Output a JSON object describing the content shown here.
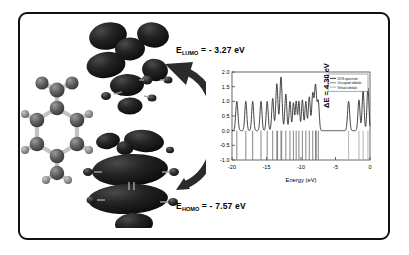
{
  "figure": {
    "kind": "graphical-abstract",
    "background": "#ffffff",
    "frame_color": "#111111"
  },
  "molecule": {
    "name": "benzene-derivative-ball-and-stick",
    "atom_color": "#5a5a5a",
    "hydrogen_color": "#8c8c8c",
    "bond_color": "#bdbdbd"
  },
  "orbitals": {
    "lumo": {
      "name": "lumo-isosurface",
      "surface_color": "#1a1a1a",
      "label": "E",
      "subscript": "LUMO",
      "equals": " = - ",
      "value": "3.27",
      "unit": " eV",
      "full_label": "ELUMO = - 3.27 eV"
    },
    "homo": {
      "name": "homo-isosurface",
      "surface_color": "#1a1a1a",
      "label": "E",
      "subscript": "HOMO",
      "equals": " = - ",
      "value": "7.57",
      "unit": " eV",
      "full_label": "EHOMO = - 7.57 eV"
    }
  },
  "arrow": {
    "name": "homo-to-lumo-transition-arrow",
    "color": "#2b2b2b",
    "direction": "bottom-to-top"
  },
  "gap_annotation": {
    "delta": "ΔE",
    "equals": " = ",
    "value": "4.30",
    "unit": " eV",
    "full_label": "ΔE = 4.30 eV"
  },
  "chart_data": {
    "type": "line",
    "title": "",
    "xlabel": "Energy (eV)",
    "ylabel": "",
    "xlim": [
      -20,
      0
    ],
    "ylim": [
      -1.0,
      2.0
    ],
    "xticks": [
      -20,
      -15,
      -10,
      -5,
      0
    ],
    "xticklabels": [
      "-20",
      "-15",
      "-10",
      "-5",
      "0"
    ],
    "yticks": [
      -1.0,
      -0.5,
      0.0,
      0.5,
      1.0,
      1.5,
      2.0
    ],
    "yticklabels": [
      "-1.0",
      "-0.5",
      "0.0",
      "0.5",
      "1.0",
      "1.5",
      "2.0"
    ],
    "grid": false,
    "legend_position": "upper right",
    "legend": [
      {
        "name": "dos-spectrum",
        "label": "DOS spectrum",
        "color": "#222222"
      },
      {
        "name": "occupied-orbitals",
        "label": "Occupied orbitals",
        "color": "#777777"
      },
      {
        "name": "virtual-orbitals",
        "label": "Virtual orbitals",
        "color": "#aaaaaa"
      }
    ],
    "series": [
      {
        "name": "DOS spectrum",
        "type": "line",
        "color": "#222222",
        "comment": "broadened density-of-states curve, baseline 0.0",
        "peaks": [
          {
            "x": -19.3,
            "height": 1.0,
            "width": 0.33
          },
          {
            "x": -18.0,
            "height": 1.0,
            "width": 0.3
          },
          {
            "x": -17.0,
            "height": 1.0,
            "width": 0.3
          },
          {
            "x": -15.8,
            "height": 1.0,
            "width": 0.3
          },
          {
            "x": -14.9,
            "height": 1.0,
            "width": 0.3
          },
          {
            "x": -14.1,
            "height": 1.1,
            "width": 0.3
          },
          {
            "x": -13.5,
            "height": 1.6,
            "width": 0.32
          },
          {
            "x": -12.9,
            "height": 1.83,
            "width": 0.34
          },
          {
            "x": -12.2,
            "height": 1.25,
            "width": 0.3
          },
          {
            "x": -11.6,
            "height": 1.0,
            "width": 0.28
          },
          {
            "x": -11.1,
            "height": 0.95,
            "width": 0.26
          },
          {
            "x": -10.7,
            "height": 1.0,
            "width": 0.26
          },
          {
            "x": -10.3,
            "height": 1.0,
            "width": 0.26
          },
          {
            "x": -9.8,
            "height": 1.05,
            "width": 0.28
          },
          {
            "x": -9.3,
            "height": 1.0,
            "width": 0.28
          },
          {
            "x": -8.8,
            "height": 1.15,
            "width": 0.3
          },
          {
            "x": -8.3,
            "height": 1.25,
            "width": 0.3
          },
          {
            "x": -7.9,
            "height": 1.55,
            "width": 0.32
          },
          {
            "x": -7.5,
            "height": 1.0,
            "width": 0.3
          },
          {
            "x": -3.1,
            "height": 1.0,
            "width": 0.32
          },
          {
            "x": -1.6,
            "height": 1.05,
            "width": 0.3
          },
          {
            "x": -1.0,
            "height": 1.35,
            "width": 0.3
          },
          {
            "x": -0.3,
            "height": 1.45,
            "width": 0.3
          }
        ]
      },
      {
        "name": "Occupied orbitals",
        "type": "stem",
        "color": "#777777",
        "comment": "vertical sticks drawn downward from 0.0 to -1.0",
        "x": [
          -19.3,
          -18.0,
          -17.0,
          -15.8,
          -14.9,
          -14.1,
          -13.5,
          -13.4,
          -12.9,
          -12.8,
          -12.2,
          -11.6,
          -11.1,
          -10.7,
          -10.3,
          -9.8,
          -9.3,
          -8.8,
          -8.3,
          -7.9,
          -7.8,
          -7.5
        ]
      },
      {
        "name": "Virtual orbitals",
        "type": "stem",
        "color": "#aaaaaa",
        "comment": "vertical sticks drawn downward from 0.0 to -1.0",
        "x": [
          -3.1,
          -1.6,
          -1.0,
          -0.3
        ]
      }
    ]
  }
}
